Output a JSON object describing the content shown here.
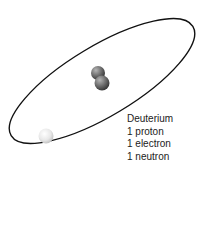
{
  "diagram": {
    "title": "Deuterium",
    "lines": [
      "1 proton",
      "1 electron",
      "1 neutron"
    ],
    "particles": {
      "nucleus": [
        "proton",
        "neutron"
      ],
      "electron": "electron"
    },
    "colors": {
      "orbit": "#111111",
      "nucleon": "#6e6e6e",
      "electron": "#eeeeee"
    }
  }
}
